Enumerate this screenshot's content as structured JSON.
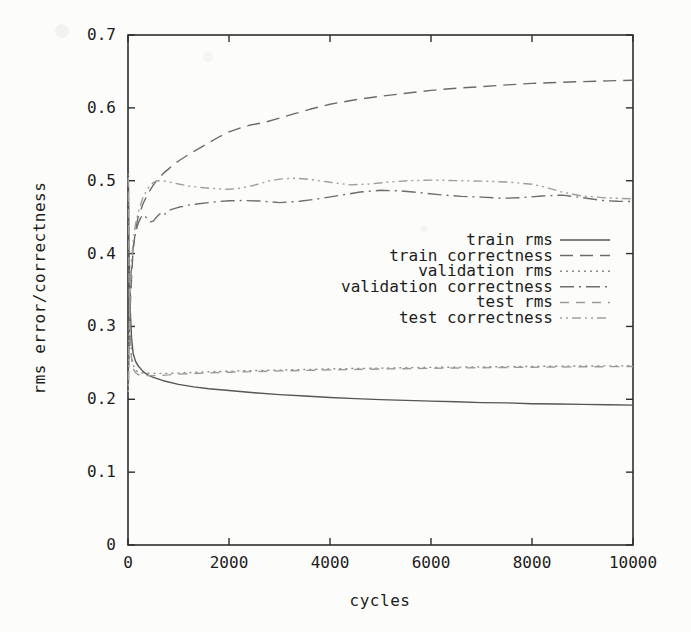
{
  "figure": {
    "background": "#fcfcfb",
    "frame_color": "#2e2e2e",
    "text_color": "#1c1c1c"
  },
  "chart_data": {
    "type": "line",
    "title": "",
    "xlabel": "cycles",
    "ylabel": "rms error/correctness",
    "xlim": [
      0,
      10000
    ],
    "ylim": [
      0,
      0.7
    ],
    "x_ticks": [
      0,
      2000,
      4000,
      6000,
      8000,
      10000
    ],
    "x_tick_labels": [
      "0",
      "2000",
      "4000",
      "6000",
      "8000",
      "10000"
    ],
    "y_ticks": [
      0,
      0.1,
      0.2,
      0.3,
      0.4,
      0.5,
      0.6,
      0.7
    ],
    "y_tick_labels": [
      "0",
      "0.1",
      "0.2",
      "0.3",
      "0.4",
      "0.5",
      "0.6",
      "0.7"
    ],
    "grid": false,
    "legend_position": "inside-right-middle",
    "series": [
      {
        "name": "train rms",
        "style": "solid",
        "dash": "",
        "color": "#565656",
        "points": [
          [
            5,
            0.52
          ],
          [
            20,
            0.4
          ],
          [
            40,
            0.33
          ],
          [
            70,
            0.285
          ],
          [
            100,
            0.263
          ],
          [
            150,
            0.252
          ],
          [
            200,
            0.246
          ],
          [
            300,
            0.238
          ],
          [
            400,
            0.233
          ],
          [
            500,
            0.23
          ],
          [
            700,
            0.2255
          ],
          [
            1000,
            0.2205
          ],
          [
            1300,
            0.217
          ],
          [
            1600,
            0.2145
          ],
          [
            2000,
            0.212
          ],
          [
            2500,
            0.209
          ],
          [
            3000,
            0.2065
          ],
          [
            3500,
            0.2045
          ],
          [
            4000,
            0.2025
          ],
          [
            4500,
            0.201
          ],
          [
            5000,
            0.1995
          ],
          [
            5500,
            0.1985
          ],
          [
            6000,
            0.1975
          ],
          [
            6500,
            0.1965
          ],
          [
            7000,
            0.1955
          ],
          [
            7500,
            0.195
          ],
          [
            8000,
            0.194
          ],
          [
            8500,
            0.1935
          ],
          [
            9000,
            0.193
          ],
          [
            9500,
            0.1925
          ],
          [
            10000,
            0.192
          ]
        ]
      },
      {
        "name": "train correctness",
        "style": "long-dash",
        "dash": "13,7",
        "color": "#6b6b6b",
        "points": [
          [
            5,
            0.215
          ],
          [
            20,
            0.27
          ],
          [
            40,
            0.32
          ],
          [
            70,
            0.365
          ],
          [
            100,
            0.405
          ],
          [
            150,
            0.433
          ],
          [
            200,
            0.45
          ],
          [
            300,
            0.469
          ],
          [
            400,
            0.483
          ],
          [
            500,
            0.494
          ],
          [
            600,
            0.503
          ],
          [
            700,
            0.51
          ],
          [
            800,
            0.516
          ],
          [
            900,
            0.522
          ],
          [
            1000,
            0.527
          ],
          [
            1200,
            0.536
          ],
          [
            1400,
            0.544
          ],
          [
            1600,
            0.552
          ],
          [
            1800,
            0.56
          ],
          [
            2000,
            0.567
          ],
          [
            2200,
            0.572
          ],
          [
            2400,
            0.576
          ],
          [
            2700,
            0.58
          ],
          [
            3000,
            0.586
          ],
          [
            3300,
            0.592
          ],
          [
            3600,
            0.598
          ],
          [
            4000,
            0.605
          ],
          [
            4500,
            0.611
          ],
          [
            5000,
            0.616
          ],
          [
            5500,
            0.62
          ],
          [
            6000,
            0.624
          ],
          [
            6500,
            0.627
          ],
          [
            7000,
            0.629
          ],
          [
            7500,
            0.6315
          ],
          [
            8000,
            0.6335
          ],
          [
            8500,
            0.635
          ],
          [
            9000,
            0.636
          ],
          [
            9500,
            0.637
          ],
          [
            10000,
            0.638
          ]
        ]
      },
      {
        "name": "validation rms",
        "style": "dotted",
        "dash": "2,4",
        "color": "#8a8a8a",
        "points": [
          [
            5,
            0.51
          ],
          [
            20,
            0.38
          ],
          [
            40,
            0.3
          ],
          [
            70,
            0.262
          ],
          [
            100,
            0.247
          ],
          [
            150,
            0.24
          ],
          [
            200,
            0.2375
          ],
          [
            300,
            0.236
          ],
          [
            500,
            0.2355
          ],
          [
            800,
            0.2355
          ],
          [
            1000,
            0.236
          ],
          [
            1500,
            0.2375
          ],
          [
            2000,
            0.2385
          ],
          [
            2500,
            0.2395
          ],
          [
            3000,
            0.24
          ],
          [
            4000,
            0.2417
          ],
          [
            5000,
            0.2428
          ],
          [
            6000,
            0.2438
          ],
          [
            7000,
            0.2445
          ],
          [
            8000,
            0.2452
          ],
          [
            9000,
            0.2457
          ],
          [
            10000,
            0.246
          ]
        ]
      },
      {
        "name": "validation correctness",
        "style": "dash-dot",
        "dash": "14,5,2,5",
        "color": "#6e6e6e",
        "points": [
          [
            5,
            0.22
          ],
          [
            20,
            0.28
          ],
          [
            40,
            0.335
          ],
          [
            70,
            0.38
          ],
          [
            100,
            0.408
          ],
          [
            150,
            0.429
          ],
          [
            200,
            0.441
          ],
          [
            250,
            0.449
          ],
          [
            300,
            0.4535
          ],
          [
            350,
            0.4505
          ],
          [
            400,
            0.446
          ],
          [
            450,
            0.4435
          ],
          [
            500,
            0.4445
          ],
          [
            550,
            0.449
          ],
          [
            600,
            0.4525
          ],
          [
            650,
            0.4555
          ],
          [
            700,
            0.4525
          ],
          [
            750,
            0.4555
          ],
          [
            800,
            0.459
          ],
          [
            900,
            0.4615
          ],
          [
            1000,
            0.4635
          ],
          [
            1200,
            0.4665
          ],
          [
            1400,
            0.4685
          ],
          [
            1600,
            0.47
          ],
          [
            1800,
            0.4715
          ],
          [
            2000,
            0.4725
          ],
          [
            2300,
            0.4728
          ],
          [
            2600,
            0.4722
          ],
          [
            3000,
            0.47
          ],
          [
            3400,
            0.4718
          ],
          [
            3800,
            0.4755
          ],
          [
            4200,
            0.48
          ],
          [
            4600,
            0.4845
          ],
          [
            5000,
            0.4868
          ],
          [
            5400,
            0.486
          ],
          [
            5800,
            0.4835
          ],
          [
            6200,
            0.4805
          ],
          [
            6600,
            0.4785
          ],
          [
            7000,
            0.4775
          ],
          [
            7400,
            0.4758
          ],
          [
            7800,
            0.4768
          ],
          [
            8200,
            0.479
          ],
          [
            8600,
            0.4802
          ],
          [
            9000,
            0.4768
          ],
          [
            9400,
            0.4728
          ],
          [
            9700,
            0.4718
          ],
          [
            10000,
            0.4715
          ]
        ]
      },
      {
        "name": "test rms",
        "style": "medium-dash",
        "dash": "9,7",
        "color": "#9a9a9a",
        "points": [
          [
            5,
            0.505
          ],
          [
            20,
            0.37
          ],
          [
            40,
            0.295
          ],
          [
            70,
            0.256
          ],
          [
            100,
            0.2425
          ],
          [
            150,
            0.2365
          ],
          [
            200,
            0.234
          ],
          [
            300,
            0.2325
          ],
          [
            500,
            0.2325
          ],
          [
            800,
            0.2335
          ],
          [
            1000,
            0.2345
          ],
          [
            1500,
            0.236
          ],
          [
            2000,
            0.2372
          ],
          [
            3000,
            0.239
          ],
          [
            4000,
            0.2403
          ],
          [
            5000,
            0.2415
          ],
          [
            6000,
            0.2425
          ],
          [
            7000,
            0.2433
          ],
          [
            8000,
            0.244
          ],
          [
            9000,
            0.2446
          ],
          [
            10000,
            0.245
          ]
        ]
      },
      {
        "name": "test correctness",
        "style": "dot-dot-dash",
        "dash": "2,4,2,4,9,4",
        "color": "#9e9e9e",
        "points": [
          [
            5,
            0.21
          ],
          [
            20,
            0.275
          ],
          [
            40,
            0.34
          ],
          [
            70,
            0.39
          ],
          [
            100,
            0.416
          ],
          [
            150,
            0.441
          ],
          [
            200,
            0.456
          ],
          [
            300,
            0.478
          ],
          [
            400,
            0.49
          ],
          [
            500,
            0.4975
          ],
          [
            600,
            0.5
          ],
          [
            700,
            0.4998
          ],
          [
            800,
            0.4985
          ],
          [
            1000,
            0.4955
          ],
          [
            1200,
            0.4928
          ],
          [
            1500,
            0.4903
          ],
          [
            1800,
            0.4888
          ],
          [
            2000,
            0.4882
          ],
          [
            2200,
            0.4895
          ],
          [
            2500,
            0.4938
          ],
          [
            2800,
            0.4998
          ],
          [
            3000,
            0.5022
          ],
          [
            3300,
            0.5035
          ],
          [
            3600,
            0.5018
          ],
          [
            4000,
            0.4978
          ],
          [
            4400,
            0.4942
          ],
          [
            4800,
            0.4955
          ],
          [
            5200,
            0.4985
          ],
          [
            5600,
            0.5002
          ],
          [
            6000,
            0.5008
          ],
          [
            6500,
            0.5002
          ],
          [
            7000,
            0.4995
          ],
          [
            7500,
            0.4982
          ],
          [
            8000,
            0.4952
          ],
          [
            8300,
            0.4905
          ],
          [
            8600,
            0.4842
          ],
          [
            9000,
            0.479
          ],
          [
            9400,
            0.4768
          ],
          [
            9700,
            0.4758
          ],
          [
            10000,
            0.4752
          ]
        ]
      }
    ]
  }
}
